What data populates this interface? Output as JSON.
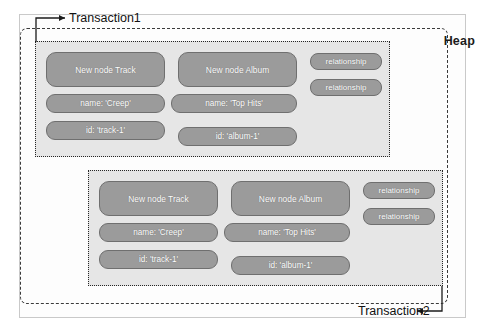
{
  "figure": {
    "heap_label": "Heap",
    "transaction1_label": "Transaction1",
    "transaction2_label": "Transaction2"
  },
  "transactions": [
    {
      "name": "Transaction1",
      "nodes": [
        {
          "title": "New node Track",
          "properties": [
            "name: 'Creep'",
            "id: 'track-1'"
          ]
        },
        {
          "title": "New node Album",
          "properties": [
            "name: 'Top Hits'",
            "id: 'album-1'"
          ]
        }
      ],
      "relationships": [
        "relationship",
        "relationship"
      ]
    },
    {
      "name": "Transaction2",
      "nodes": [
        {
          "title": "New node Track",
          "properties": [
            "name: 'Creep'",
            "id: 'track-1'"
          ]
        },
        {
          "title": "New node Album",
          "properties": [
            "name: 'Top Hits'",
            "id: 'album-1'"
          ]
        }
      ],
      "relationships": [
        "relationship",
        "relationship"
      ]
    }
  ],
  "colors": {
    "chip_fill": "#9b9b9b",
    "chip_border": "#6f6f6f",
    "txn_fill": "#e6e6e6",
    "heap_border": "#3a3a3a",
    "text_on_chip": "#ffffff"
  }
}
